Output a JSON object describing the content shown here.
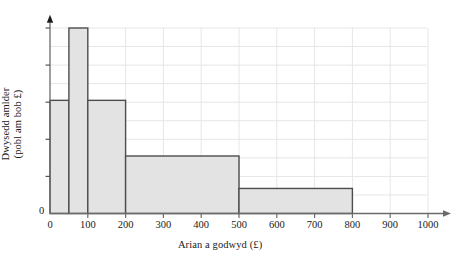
{
  "chart_data": {
    "type": "bar",
    "title": "",
    "subtitle": "",
    "xlabel": "Arian a godwyd (£)",
    "ylabel_line1": "Dwysedd amlder",
    "ylabel_line2": "(pobl am bob £)",
    "ylabel": "Dwysedd amlder (pobl am bob £)",
    "grid": true,
    "legend": "none",
    "xlim": [
      0,
      1000
    ],
    "ylim": [
      0,
      10
    ],
    "xticks": [
      0,
      100,
      200,
      300,
      400,
      500,
      600,
      700,
      800,
      900,
      1000
    ],
    "xtick_labels": [
      "0",
      "100",
      "200",
      "300",
      "400",
      "500",
      "600",
      "700",
      "800",
      "900",
      "1000"
    ],
    "ytick_labels": [
      "0"
    ],
    "y_gridline_count": 10,
    "bin_edges": [
      0,
      50,
      100,
      200,
      500,
      800
    ],
    "bin_labels": [
      "0–50",
      "50–100",
      "100–200",
      "200–500",
      "500–800"
    ],
    "values": [
      6.1,
      10.0,
      6.1,
      3.1,
      1.35
    ],
    "series": [
      {
        "name": "Dwysedd amlder",
        "values": [
          6.1,
          10.0,
          6.1,
          3.1,
          1.35
        ]
      }
    ],
    "bars": [
      {
        "label": "0–50",
        "x0": 0,
        "x1": 50,
        "value": 6.1
      },
      {
        "label": "50–100",
        "x0": 50,
        "x1": 100,
        "value": 10.0
      },
      {
        "label": "100–200",
        "x0": 100,
        "x1": 200,
        "value": 6.1
      },
      {
        "label": "200–500",
        "x0": 200,
        "x1": 500,
        "value": 3.1
      },
      {
        "label": "500–800",
        "x0": 500,
        "x1": 800,
        "value": 1.35
      }
    ],
    "bar_fill": "#e3e3e3",
    "bar_stroke": "#4d4d4d",
    "grid_color": "#e6e6e6",
    "axis_color": "#6b6b6b"
  }
}
